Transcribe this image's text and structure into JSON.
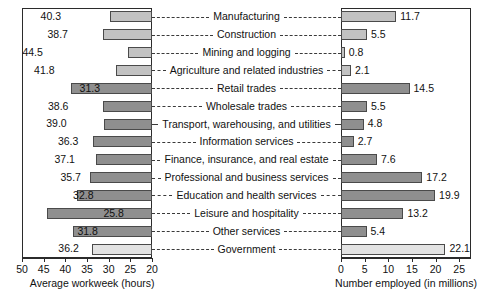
{
  "chart_data": {
    "type": "bar",
    "title": "",
    "orientation": "horizontal",
    "layout": "two-panel mirrored bar chart with shared centered category labels",
    "categories": [
      "Manufacturing",
      "Construction",
      "Mining and logging",
      "Agriculture and related industries",
      "Retail trades",
      "Wholesale trades",
      "Transport, warehousing, and utilities",
      "Information services",
      "Finance, insurance, and real estate",
      "Professional and business services",
      "Education and health services",
      "Leisure and hospitality",
      "Other services",
      "Government"
    ],
    "groups": [
      "goods",
      "goods",
      "goods",
      "goods",
      "service",
      "service",
      "service",
      "service",
      "service",
      "service",
      "service",
      "service",
      "service",
      "gov"
    ],
    "series": [
      {
        "name": "Average workweek (hours)",
        "panel": "left",
        "xlabel": "Average workweek (hours)",
        "ylabel": "",
        "xlim": [
          50,
          20
        ],
        "reversed": true,
        "ticks": [
          50,
          45,
          40,
          35,
          30,
          25,
          20
        ],
        "tick_labels": [
          "50",
          "45",
          "40",
          "35",
          "30",
          "25",
          "20"
        ],
        "values": [
          40.3,
          38.7,
          44.5,
          41.8,
          31.3,
          38.6,
          39.0,
          36.3,
          37.1,
          35.7,
          32.8,
          25.8,
          31.8,
          36.2
        ],
        "value_labels": [
          "40.3",
          "38.7",
          "44.5",
          "41.8",
          "31.3",
          "38.6",
          "39.0",
          "36.3",
          "37.1",
          "35.7",
          "32.8",
          "25.8",
          "31.8",
          "36.2"
        ]
      },
      {
        "name": "Number employed (in millions)",
        "panel": "right",
        "xlabel": "Number employed (in millions)",
        "ylabel": "",
        "xlim": [
          0,
          27.5
        ],
        "reversed": false,
        "ticks": [
          0,
          5,
          10,
          15,
          20,
          25
        ],
        "tick_labels": [
          "0",
          "5",
          "10",
          "15",
          "20",
          "25"
        ],
        "values": [
          11.7,
          5.5,
          0.8,
          2.1,
          14.5,
          5.5,
          4.8,
          2.7,
          7.6,
          17.2,
          19.9,
          13.2,
          5.4,
          22.1
        ],
        "value_labels": [
          "11.7",
          "5.5",
          "0.8",
          "2.1",
          "14.5",
          "5.5",
          "4.8",
          "2.7",
          "7.6",
          "17.2",
          "19.9",
          "13.2",
          "5.4",
          "22.1"
        ]
      }
    ],
    "grid": false,
    "legend": null,
    "colors": {
      "goods": "#c2c2c2",
      "service": "#8f8f8f",
      "gov": "#e3e3e3",
      "bar_border": "#4a4a4a",
      "axis": "#2b2b2b",
      "text": "#111111",
      "background": "#ffffff"
    }
  },
  "left_panel": {
    "axis_title": "Average workweek (hours)"
  },
  "right_panel": {
    "axis_title": "Number employed (in millions)"
  }
}
